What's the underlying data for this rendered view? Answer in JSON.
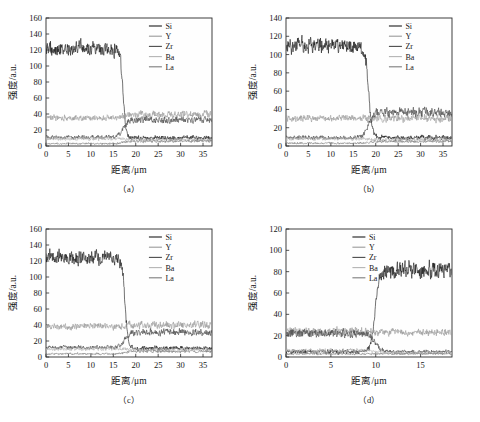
{
  "figure": {
    "background": "#ffffff",
    "panel_count": 4
  },
  "series_styles": {
    "Si": "#1c1c1c",
    "Y": "#9a9a9a",
    "Zr": "#4a4a4a",
    "Ba": "#b4b4b4",
    "La": "#7d7d7d"
  },
  "chart_data": [
    {
      "id": "a",
      "type": "line",
      "caption": "（a）",
      "title": "",
      "xlabel": "距离/μm",
      "ylabel": "强度/a.u.",
      "xlim": [
        0,
        37
      ],
      "ylim": [
        0,
        160
      ],
      "xticks": [
        0,
        5,
        10,
        15,
        20,
        25,
        30,
        35
      ],
      "yticks": [
        0,
        20,
        40,
        60,
        80,
        100,
        120,
        140,
        160
      ],
      "grid": false,
      "legend_position": "top-right",
      "legend": [
        "Si",
        "Y",
        "Zr",
        "Ba",
        "La"
      ],
      "transition_x": 17.2,
      "series": [
        {
          "name": "Si",
          "level_left": 122,
          "level_right": 10,
          "noise_left": 13,
          "noise_right": 4,
          "edge_width": 1.0
        },
        {
          "name": "Y",
          "level_left": 35,
          "level_right": 39,
          "noise_left": 5,
          "noise_right": 7,
          "edge_width": 1.6
        },
        {
          "name": "Zr",
          "level_left": 11,
          "level_right": 33,
          "noise_left": 3.4,
          "noise_right": 6,
          "edge_width": 2.0
        },
        {
          "name": "Ba",
          "level_left": 9,
          "level_right": 8,
          "noise_left": 3,
          "noise_right": 3,
          "edge_width": 1.6
        },
        {
          "name": "La",
          "level_left": 3,
          "level_right": 6,
          "noise_left": 1.6,
          "noise_right": 2.4,
          "edge_width": 2.0
        }
      ]
    },
    {
      "id": "b",
      "type": "line",
      "caption": "（b）",
      "title": "",
      "xlabel": "距离/μm",
      "ylabel": "强度/a.u.",
      "xlim": [
        0,
        37
      ],
      "ylim": [
        0,
        140
      ],
      "xticks": [
        0,
        5,
        10,
        15,
        20,
        25,
        30,
        35
      ],
      "yticks": [
        0,
        20,
        40,
        60,
        80,
        100,
        120,
        140
      ],
      "grid": false,
      "legend_position": "top-right",
      "legend": [
        "Si",
        "Y",
        "Zr",
        "Ba",
        "La"
      ],
      "transition_x": 18.4,
      "series": [
        {
          "name": "Si",
          "level_left": 110,
          "level_right": 9,
          "noise_left": 12,
          "noise_right": 4,
          "edge_width": 1.3
        },
        {
          "name": "Y",
          "level_left": 30,
          "level_right": 30,
          "noise_left": 5,
          "noise_right": 6,
          "edge_width": 1.6
        },
        {
          "name": "Zr",
          "level_left": 9,
          "level_right": 37,
          "noise_left": 3.2,
          "noise_right": 7,
          "edge_width": 2.0
        },
        {
          "name": "Ba",
          "level_left": 8,
          "level_right": 7,
          "noise_left": 2.8,
          "noise_right": 2.8,
          "edge_width": 1.6
        },
        {
          "name": "La",
          "level_left": 3,
          "level_right": 5,
          "noise_left": 1.5,
          "noise_right": 2.2,
          "edge_width": 2.0
        }
      ]
    },
    {
      "id": "c",
      "type": "line",
      "caption": "（c）",
      "title": "",
      "xlabel": "距离/μm",
      "ylabel": "强度/a.u.",
      "xlim": [
        0,
        37
      ],
      "ylim": [
        0,
        160
      ],
      "xticks": [
        0,
        5,
        10,
        15,
        20,
        25,
        30,
        35
      ],
      "yticks": [
        0,
        20,
        40,
        60,
        80,
        100,
        120,
        140,
        160
      ],
      "grid": false,
      "legend_position": "top-right",
      "legend": [
        "Si",
        "Y",
        "Zr",
        "Ba",
        "La"
      ],
      "transition_x": 17.6,
      "series": [
        {
          "name": "Si",
          "level_left": 124,
          "level_right": 11,
          "noise_left": 13,
          "noise_right": 4,
          "edge_width": 1.1
        },
        {
          "name": "Y",
          "level_left": 38,
          "level_right": 40,
          "noise_left": 5.5,
          "noise_right": 7,
          "edge_width": 1.6
        },
        {
          "name": "Zr",
          "level_left": 12,
          "level_right": 31,
          "noise_left": 3.5,
          "noise_right": 6,
          "edge_width": 2.0
        },
        {
          "name": "Ba",
          "level_left": 10,
          "level_right": 9,
          "noise_left": 3,
          "noise_right": 3,
          "edge_width": 1.6
        },
        {
          "name": "La",
          "level_left": 4,
          "level_right": 7,
          "noise_left": 1.8,
          "noise_right": 2.4,
          "edge_width": 2.0
        }
      ]
    },
    {
      "id": "d",
      "type": "line",
      "caption": "（d）",
      "title": "",
      "xlabel": "距离/μm",
      "ylabel": "强度/a.u.",
      "xlim": [
        0,
        18.5
      ],
      "ylim": [
        0,
        120
      ],
      "xticks": [
        0,
        5,
        10,
        15
      ],
      "yticks": [
        0,
        20,
        40,
        60,
        80,
        100,
        120
      ],
      "grid": false,
      "legend_position": "top-center",
      "legend": [
        "Si",
        "Y",
        "Zr",
        "Ba",
        "La"
      ],
      "transition_x": 9.9,
      "series": [
        {
          "name": "Si",
          "level_left": 5,
          "level_right": 81,
          "noise_left": 3,
          "noise_right": 11,
          "edge_width": 0.7
        },
        {
          "name": "Y",
          "level_left": 24,
          "level_right": 23,
          "noise_left": 5,
          "noise_right": 4.5,
          "edge_width": 1.2
        },
        {
          "name": "Zr",
          "level_left": 22,
          "level_right": 5,
          "noise_left": 5.5,
          "noise_right": 2.4,
          "edge_width": 1.2
        },
        {
          "name": "Ba",
          "level_left": 6,
          "level_right": 4,
          "noise_left": 2.6,
          "noise_right": 2,
          "edge_width": 1.2
        },
        {
          "name": "La",
          "level_left": 3,
          "level_right": 3,
          "noise_left": 1.4,
          "noise_right": 1.4,
          "edge_width": 1.2
        }
      ]
    }
  ]
}
